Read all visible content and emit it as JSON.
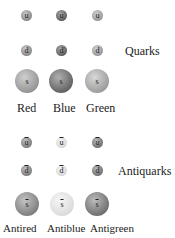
{
  "quarks": {
    "group_label": "Quarks",
    "columns": [
      {
        "label": "Red",
        "color": "#9a9a9a"
      },
      {
        "label": "Blue",
        "color": "#6e6e6e"
      },
      {
        "label": "Green",
        "color": "#a6a6a6"
      }
    ],
    "rows": [
      {
        "symbol": "u",
        "size": "small"
      },
      {
        "symbol": "d",
        "size": "small"
      },
      {
        "symbol": "s",
        "size": "big"
      }
    ]
  },
  "antiquarks": {
    "group_label": "Antiquarks",
    "columns": [
      {
        "label": "Antired",
        "color": "#8a8a8a"
      },
      {
        "label": "Antiblue",
        "color": "#dcdcdc"
      },
      {
        "label": "Antigreen",
        "color": "#7c7c7c"
      }
    ],
    "rows": [
      {
        "symbol": "u",
        "size": "small",
        "overline": true
      },
      {
        "symbol": "d",
        "size": "small",
        "overline": true
      },
      {
        "symbol": "s",
        "size": "big",
        "overline": true
      }
    ]
  }
}
